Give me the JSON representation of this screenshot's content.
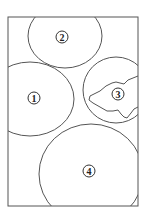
{
  "diagram": {
    "regions": [
      {
        "id": "region-1",
        "label": "1"
      },
      {
        "id": "region-2",
        "label": "2"
      },
      {
        "id": "region-3",
        "label": "3"
      },
      {
        "id": "region-4",
        "label": "4"
      }
    ]
  }
}
